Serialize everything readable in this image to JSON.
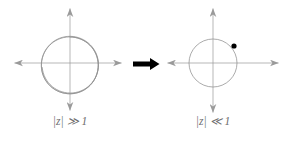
{
  "figure": {
    "type": "diagram",
    "width": 287,
    "height": 142,
    "background_color": "#ffffff"
  },
  "colors": {
    "axis": "#9a9a9a",
    "curve": "#8f8f8f",
    "arrow": "#000000",
    "point": "#000000",
    "caption": "#6e6e6e"
  },
  "panels": [
    {
      "id": "left",
      "name": "large-modulus-panel",
      "caption": "|z| ≫ 1",
      "caption_parts": {
        "modulus": "|z|",
        "relation": "≫",
        "value": "1"
      },
      "center": {
        "x": 70,
        "y": 63
      },
      "axes": {
        "x_axis": {
          "x1": 14,
          "x2": 122,
          "y": 63,
          "arrowheads": [
            "left",
            "right"
          ]
        },
        "y_axis": {
          "y1": 8,
          "y2": 111,
          "x": 70,
          "arrowheads": [
            "up",
            "down"
          ]
        }
      },
      "curve": {
        "kind": "spiral",
        "turns": 4,
        "inner_radius": 26,
        "outer_radius": 33,
        "stroke_width": 0.7
      }
    },
    {
      "id": "right",
      "name": "small-modulus-panel",
      "caption": "|z| ≪ 1",
      "caption_parts": {
        "modulus": "|z|",
        "relation": "≪",
        "value": "1"
      },
      "center": {
        "x": 213,
        "y": 63
      },
      "axes": {
        "x_axis": {
          "x1": 167,
          "x2": 279,
          "y": 63,
          "arrowheads": [
            "left",
            "right"
          ]
        },
        "y_axis": {
          "y1": 8,
          "y2": 113,
          "x": 213,
          "arrowheads": [
            "up",
            "down"
          ]
        }
      },
      "curve": {
        "kind": "circle",
        "radius": 24,
        "stroke_width": 0.7
      },
      "marked_point": {
        "name": "marked-point-z",
        "x": 234,
        "y": 46,
        "radius": 2.6,
        "fill": "#000000"
      }
    }
  ],
  "transform_arrow": {
    "name": "transform-arrow",
    "x1": 133,
    "x2": 159,
    "y": 64,
    "shaft_width": 4.5,
    "head_length": 9,
    "head_width": 12,
    "color": "#000000"
  }
}
